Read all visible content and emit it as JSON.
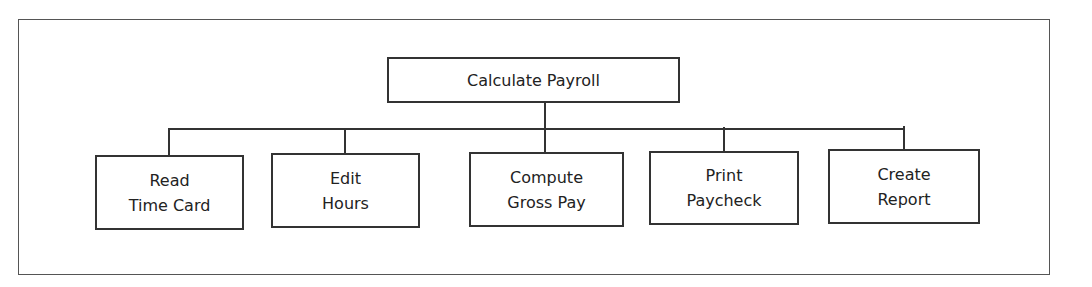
{
  "diagram": {
    "type": "hierarchy-chart",
    "root": {
      "label": "Calculate Payroll"
    },
    "children": [
      {
        "line1": "Read",
        "line2": "Time Card"
      },
      {
        "line1": "Edit",
        "line2": "Hours"
      },
      {
        "line1": "Compute",
        "line2": "Gross Pay"
      },
      {
        "line1": "Print",
        "line2": "Paycheck"
      },
      {
        "line1": "Create",
        "line2": "Report"
      }
    ]
  }
}
